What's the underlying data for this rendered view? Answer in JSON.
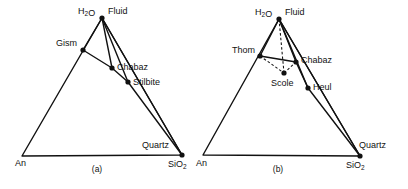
{
  "figure": {
    "background_color": "#ffffff",
    "line_color": "#111111",
    "panels": [
      {
        "id": "a",
        "caption": "(a)",
        "caption_pos": [
          97,
          172
        ],
        "vertices": {
          "apex": {
            "label": "H₂O",
            "pos": [
              102,
              18
            ],
            "label_pos": [
              78,
              14
            ],
            "dot": true
          },
          "left": {
            "label": "An",
            "pos": [
              22,
              156
            ],
            "label_pos": [
              15,
              166
            ],
            "dot": false
          },
          "right": {
            "label": "SiO₂",
            "pos": [
              182,
              155
            ],
            "label_pos": [
              168,
              167
            ],
            "dot": true
          }
        },
        "points": [
          {
            "name": "Fluid",
            "label": "Fluid",
            "pos": [
              102,
              18
            ],
            "label_pos": [
              108,
              14
            ],
            "dot": false
          },
          {
            "name": "Gism",
            "label": "Gism",
            "pos": [
              83,
              50
            ],
            "label_pos": [
              56,
              46
            ],
            "dot": true
          },
          {
            "name": "Chabaz",
            "label": "Chabaz",
            "pos": [
              112,
              68
            ],
            "label_pos": [
              117,
              70
            ],
            "dot": true
          },
          {
            "name": "Stilbite",
            "label": "Stilbite",
            "pos": [
              128,
              82
            ],
            "label_pos": [
              133,
              85
            ],
            "dot": true
          },
          {
            "name": "Quartz",
            "label": "Quartz",
            "pos": [
              182,
              155
            ],
            "label_pos": [
              142,
              148
            ],
            "dot": false
          }
        ],
        "tielines": [
          {
            "from": [
              102,
              18
            ],
            "to": [
              83,
              50
            ],
            "style": "solid"
          },
          {
            "from": [
              102,
              18
            ],
            "to": [
              112,
              68
            ],
            "style": "solid"
          },
          {
            "from": [
              102,
              18
            ],
            "to": [
              128,
              82
            ],
            "style": "solid"
          },
          {
            "from": [
              102,
              18
            ],
            "to": [
              182,
              155
            ],
            "style": "solid"
          },
          {
            "from": [
              83,
              50
            ],
            "to": [
              112,
              68
            ],
            "style": "solid"
          },
          {
            "from": [
              112,
              68
            ],
            "to": [
              128,
              82
            ],
            "style": "solid"
          },
          {
            "from": [
              128,
              82
            ],
            "to": [
              182,
              155
            ],
            "style": "solid"
          }
        ],
        "triangle": [
          [
            102,
            18
          ],
          [
            22,
            156
          ],
          [
            182,
            155
          ]
        ]
      },
      {
        "id": "b",
        "caption": "(b)",
        "caption_pos": [
          278,
          172
        ],
        "vertices": {
          "apex": {
            "label": "H₂O",
            "pos": [
              279,
              19
            ],
            "label_pos": [
              255,
              15
            ],
            "dot": true
          },
          "left": {
            "label": "An",
            "pos": [
              203,
              155
            ],
            "label_pos": [
              196,
              166
            ],
            "dot": false
          },
          "right": {
            "label": "SiO₂",
            "pos": [
              360,
              156
            ],
            "label_pos": [
              346,
              168
            ],
            "dot": true
          }
        },
        "points": [
          {
            "name": "Fluid",
            "label": "Fluid",
            "pos": [
              279,
              19
            ],
            "label_pos": [
              285,
              15
            ],
            "dot": false
          },
          {
            "name": "Thom",
            "label": "Thom",
            "pos": [
              260,
              56
            ],
            "label_pos": [
              232,
              53
            ],
            "dot": true
          },
          {
            "name": "Chabaz",
            "label": "Chabaz",
            "pos": [
              296,
              62
            ],
            "label_pos": [
              301,
              63
            ],
            "dot": true
          },
          {
            "name": "Scole",
            "label": "Scole",
            "pos": [
              284,
              73
            ],
            "label_pos": [
              271,
              86
            ],
            "dot": true
          },
          {
            "name": "Heul",
            "label": "Heul",
            "pos": [
              308,
              88
            ],
            "label_pos": [
              313,
              90
            ],
            "dot": true
          },
          {
            "name": "Quartz",
            "label": "Quartz",
            "pos": [
              360,
              156
            ],
            "label_pos": [
              359,
              148
            ],
            "dot": false
          }
        ],
        "tielines": [
          {
            "from": [
              279,
              19
            ],
            "to": [
              260,
              56
            ],
            "style": "solid"
          },
          {
            "from": [
              279,
              19
            ],
            "to": [
              296,
              62
            ],
            "style": "solid"
          },
          {
            "from": [
              279,
              19
            ],
            "to": [
              308,
              88
            ],
            "style": "solid"
          },
          {
            "from": [
              279,
              19
            ],
            "to": [
              360,
              156
            ],
            "style": "solid"
          },
          {
            "from": [
              279,
              19
            ],
            "to": [
              284,
              73
            ],
            "style": "dashed"
          },
          {
            "from": [
              260,
              56
            ],
            "to": [
              296,
              62
            ],
            "style": "solid"
          },
          {
            "from": [
              260,
              56
            ],
            "to": [
              284,
              73
            ],
            "style": "dashed"
          },
          {
            "from": [
              284,
              73
            ],
            "to": [
              296,
              62
            ],
            "style": "dashed"
          },
          {
            "from": [
              296,
              62
            ],
            "to": [
              308,
              88
            ],
            "style": "solid"
          },
          {
            "from": [
              308,
              88
            ],
            "to": [
              360,
              156
            ],
            "style": "solid"
          }
        ],
        "triangle": [
          [
            279,
            19
          ],
          [
            203,
            155
          ],
          [
            360,
            156
          ]
        ]
      }
    ]
  },
  "chart_data": {
    "type": "scatter",
    "title": "",
    "xlabel": "",
    "ylabel": "",
    "components": [
      "H2O",
      "An",
      "SiO2"
    ],
    "panels": [
      {
        "label": "(a)",
        "corner_labels": [
          "H2O",
          "An",
          "SiO2"
        ],
        "phases": [
          "Fluid",
          "Gism",
          "Chabaz",
          "Stilbite",
          "Quartz"
        ],
        "tieline_pairs": [
          [
            "Fluid",
            "Gism"
          ],
          [
            "Fluid",
            "Chabaz"
          ],
          [
            "Fluid",
            "Stilbite"
          ],
          [
            "Fluid",
            "Quartz"
          ],
          [
            "Gism",
            "Chabaz"
          ],
          [
            "Chabaz",
            "Stilbite"
          ],
          [
            "Stilbite",
            "Quartz"
          ]
        ],
        "dashed_tielines": []
      },
      {
        "label": "(b)",
        "corner_labels": [
          "H2O",
          "An",
          "SiO2"
        ],
        "phases": [
          "Fluid",
          "Thom",
          "Chabaz",
          "Scole",
          "Heul",
          "Quartz"
        ],
        "tieline_pairs": [
          [
            "Fluid",
            "Thom"
          ],
          [
            "Fluid",
            "Chabaz"
          ],
          [
            "Fluid",
            "Heul"
          ],
          [
            "Fluid",
            "Quartz"
          ],
          [
            "Thom",
            "Chabaz"
          ],
          [
            "Chabaz",
            "Heul"
          ],
          [
            "Heul",
            "Quartz"
          ]
        ],
        "dashed_tielines": [
          [
            "Fluid",
            "Scole"
          ],
          [
            "Thom",
            "Scole"
          ],
          [
            "Scole",
            "Chabaz"
          ]
        ]
      }
    ]
  }
}
